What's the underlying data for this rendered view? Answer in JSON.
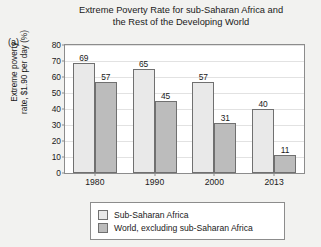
{
  "panel_label": "(a)",
  "chart_data": {
    "type": "bar",
    "title_lines": [
      "Extreme Poverty Rate for sub-Saharan Africa and",
      "the Rest of the Developing World"
    ],
    "title": "Extreme Poverty Rate for sub-Saharan Africa and the Rest of the Developing World",
    "categories": [
      "1980",
      "1990",
      "2000",
      "2013"
    ],
    "series": [
      {
        "name": "Sub-Saharan Africa",
        "values": [
          69,
          65,
          57,
          40
        ],
        "color": "#e9e9e9"
      },
      {
        "name": "World, excluding sub-Saharan Africa",
        "values": [
          57,
          45,
          31,
          11
        ],
        "color": "#bcbcbc"
      }
    ],
    "xlabel": "",
    "ylabel": "Extreme poverty rate, $1.90 per day (%)",
    "ylabel_lines": [
      "Extreme poverty",
      "rate, $1.90 per day (%)"
    ],
    "ylim": [
      0,
      80
    ],
    "yticks": [
      0,
      10,
      20,
      30,
      40,
      50,
      60,
      70,
      80
    ],
    "grid": true,
    "legend_position": "bottom",
    "data_labels": true
  }
}
